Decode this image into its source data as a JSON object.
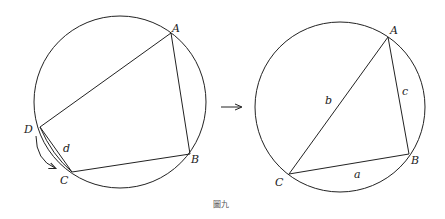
{
  "figure": {
    "caption": "圖九",
    "left": {
      "circle": {
        "cx": 120,
        "cy": 102,
        "r": 86
      },
      "points": {
        "A": {
          "x": 171,
          "y": 33,
          "label": "A"
        },
        "B": {
          "x": 190,
          "y": 154,
          "label": "B"
        },
        "C": {
          "x": 72,
          "y": 172,
          "label": "C"
        },
        "D": {
          "x": 40,
          "y": 127,
          "label": "D"
        }
      },
      "side_label": "d"
    },
    "right": {
      "circle": {
        "cx": 340,
        "cy": 107,
        "r": 85
      },
      "points": {
        "A": {
          "x": 388,
          "y": 37,
          "label": "A"
        },
        "B": {
          "x": 409,
          "y": 154,
          "label": "B"
        },
        "C": {
          "x": 289,
          "y": 174,
          "label": "C"
        }
      },
      "side_labels": {
        "a": "a",
        "b": "b",
        "c": "c"
      }
    },
    "stroke_color": "#222222"
  }
}
